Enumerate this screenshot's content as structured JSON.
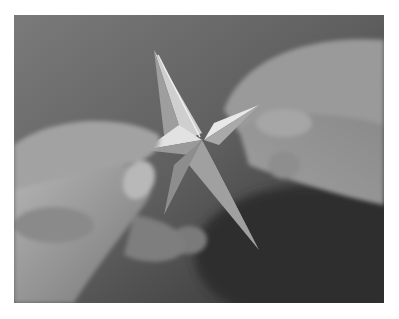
{
  "image": {
    "subject": "Two hands folding a paper origami star",
    "style": "grayscale photograph",
    "caption_remnant": "",
    "elements": [
      {
        "name": "origami-star",
        "description": "five-pointed paper star, light gray, center near photo middle"
      },
      {
        "name": "left-hand",
        "description": "hand from lower-left pinching left star point between thumb and finger"
      },
      {
        "name": "right-hand",
        "description": "hand from upper-right holding right star point"
      },
      {
        "name": "background",
        "description": "dark gray blurred background"
      }
    ],
    "colors": {
      "background": "#6e6e6e",
      "dark_background": "#3a3a3a",
      "skin_light": "#a8a8a8",
      "skin_mid": "#8c8c8c",
      "paper_light": "#e6e6e6",
      "paper_mid": "#bdbdbd",
      "paper_shadow": "#8f8f8f"
    }
  }
}
